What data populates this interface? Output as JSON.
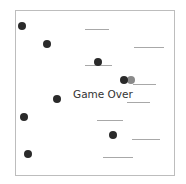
{
  "game": {
    "status_text": "Game Over",
    "colors": {
      "ball": "#2a2a2a",
      "ball_ghost": "#8a8a8a",
      "platform": "#a8a8a8",
      "border": "#bdbdbd"
    },
    "balls": [
      {
        "x": 22,
        "y": 26
      },
      {
        "x": 47,
        "y": 44
      },
      {
        "x": 98,
        "y": 62
      },
      {
        "x": 124,
        "y": 80
      },
      {
        "x": 57,
        "y": 99
      },
      {
        "x": 24,
        "y": 117
      },
      {
        "x": 113,
        "y": 135
      },
      {
        "x": 28,
        "y": 154
      }
    ],
    "ghost_balls": [
      {
        "x": 131,
        "y": 80
      }
    ],
    "platforms": [
      {
        "x1": 85,
        "x2": 109,
        "y": 29
      },
      {
        "x1": 134,
        "x2": 164,
        "y": 47
      },
      {
        "x1": 85,
        "x2": 112,
        "y": 65
      },
      {
        "x1": 133,
        "x2": 156,
        "y": 84
      },
      {
        "x1": 127,
        "x2": 150,
        "y": 102
      },
      {
        "x1": 97,
        "x2": 123,
        "y": 120
      },
      {
        "x1": 132,
        "x2": 160,
        "y": 139
      },
      {
        "x1": 103,
        "x2": 133,
        "y": 157
      }
    ]
  }
}
